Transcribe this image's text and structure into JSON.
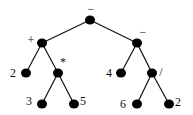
{
  "diagram": {
    "type": "expression-tree",
    "expression": "(2 + 3 * 5) - (4 - 6 / 2)",
    "nodes": [
      {
        "id": "n0",
        "label": "−",
        "x": 90,
        "y": 20,
        "lx": 91,
        "ly": 13,
        "kind": "operator"
      },
      {
        "id": "n1",
        "label": "+",
        "x": 42,
        "y": 43,
        "lx": 31,
        "ly": 44,
        "kind": "operator"
      },
      {
        "id": "n2",
        "label": "−",
        "x": 137,
        "y": 43,
        "lx": 143,
        "ly": 36,
        "kind": "operator"
      },
      {
        "id": "n3",
        "label": "2",
        "x": 26,
        "y": 73,
        "lx": 13,
        "ly": 77,
        "kind": "operand"
      },
      {
        "id": "n4",
        "label": "*",
        "x": 58,
        "y": 73,
        "lx": 63,
        "ly": 66,
        "kind": "operator"
      },
      {
        "id": "n5",
        "label": "4",
        "x": 121,
        "y": 73,
        "lx": 109,
        "ly": 77,
        "kind": "operand"
      },
      {
        "id": "n6",
        "label": "/",
        "x": 152,
        "y": 73,
        "lx": 161,
        "ly": 76,
        "kind": "operator"
      },
      {
        "id": "n7",
        "label": "3",
        "x": 42,
        "y": 104,
        "lx": 29,
        "ly": 105,
        "kind": "operand"
      },
      {
        "id": "n8",
        "label": "5",
        "x": 74,
        "y": 104,
        "lx": 83,
        "ly": 105,
        "kind": "operand"
      },
      {
        "id": "n9",
        "label": "6",
        "x": 137,
        "y": 104,
        "lx": 123,
        "ly": 108,
        "kind": "operand"
      },
      {
        "id": "n10",
        "label": "2",
        "x": 169,
        "y": 104,
        "lx": 178,
        "ly": 106,
        "kind": "operand"
      }
    ],
    "edges": [
      [
        "n0",
        "n1"
      ],
      [
        "n0",
        "n2"
      ],
      [
        "n1",
        "n3"
      ],
      [
        "n1",
        "n4"
      ],
      [
        "n2",
        "n5"
      ],
      [
        "n2",
        "n6"
      ],
      [
        "n4",
        "n7"
      ],
      [
        "n4",
        "n8"
      ],
      [
        "n6",
        "n9"
      ],
      [
        "n6",
        "n10"
      ]
    ],
    "colors": {
      "node": "#000000",
      "edge": "#111111",
      "label": "#111111",
      "background": "#ffffff"
    }
  }
}
